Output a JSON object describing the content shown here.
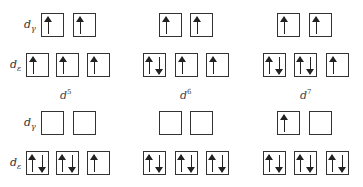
{
  "labels": {
    "dgamma": {
      "base": "d",
      "sub": "γ"
    },
    "depsilon": {
      "base": "d",
      "sub": "ε"
    }
  },
  "columns": [
    {
      "id": "d5",
      "config": {
        "base": "d",
        "sup": "5"
      }
    },
    {
      "id": "d6",
      "config": {
        "base": "d",
        "sup": "6"
      }
    },
    {
      "id": "d7",
      "config": {
        "base": "d",
        "sup": "7"
      }
    }
  ],
  "diagrams": [
    {
      "row": "top",
      "column": "d5",
      "dgamma": [
        "up",
        "up"
      ],
      "depsilon": [
        "up",
        "up",
        "up"
      ]
    },
    {
      "row": "top",
      "column": "d6",
      "dgamma": [
        "up",
        "up"
      ],
      "depsilon": [
        "updown",
        "up",
        "up"
      ]
    },
    {
      "row": "top",
      "column": "d7",
      "dgamma": [
        "up",
        "up"
      ],
      "depsilon": [
        "updown",
        "updown",
        "up"
      ]
    },
    {
      "row": "bottom",
      "column": "d5",
      "dgamma": [
        "empty",
        "empty"
      ],
      "depsilon": [
        "updown",
        "updown",
        "up"
      ]
    },
    {
      "row": "bottom",
      "column": "d6",
      "dgamma": [
        "empty",
        "empty"
      ],
      "depsilon": [
        "updown",
        "updown",
        "updown"
      ]
    },
    {
      "row": "bottom",
      "column": "d7",
      "dgamma": [
        "up",
        "empty"
      ],
      "depsilon": [
        "updown",
        "updown",
        "updown"
      ]
    }
  ]
}
